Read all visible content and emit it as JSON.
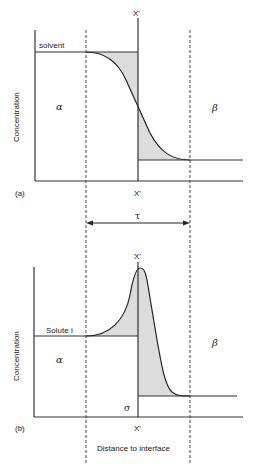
{
  "figure": {
    "xlabel": "Distance to interface",
    "panel_a": {
      "tag": "(a)",
      "ylabel": "Concentration",
      "curve_label": "solvent",
      "interface_label_top": "X'",
      "interface_label_bottom": "X'",
      "phase_left": "α",
      "phase_right": "β"
    },
    "width_label": "τ",
    "panel_b": {
      "tag": "(b)",
      "ylabel": "Concentration",
      "curve_label": "Solute i",
      "interface_label_top": "X'",
      "interface_label_bottom": "X'",
      "phase_left": "α",
      "phase_right": "β",
      "excess_label": "σ"
    },
    "colors": {
      "line": "#222222",
      "shade": "#dcdcdc",
      "background": "#ffffff"
    }
  }
}
